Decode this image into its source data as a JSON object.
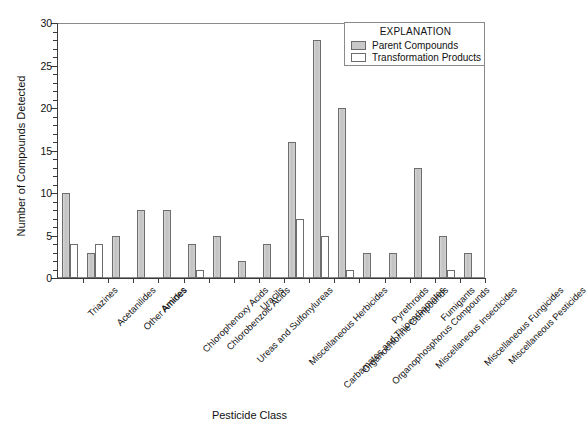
{
  "chart_data": {
    "type": "bar",
    "title": "",
    "xlabel": "Pesticide Class",
    "ylabel": "Number of Compounds Detected",
    "ylim": [
      0,
      30
    ],
    "yticks": [
      0,
      5,
      10,
      15,
      20,
      25,
      30
    ],
    "grid": false,
    "legend_position": "top-right",
    "legend_title": "EXPLANATION",
    "categories": [
      "Triazines",
      "Acetanilides",
      "Other Amides",
      "Amines",
      "Chlorophenoxy Acids",
      "Chlorobenzoic Acids",
      "Ureas and Sulfonylureas",
      "Uracils",
      "Miscellaneous Herbicides",
      "Carbamates and Thiocarbamates",
      "Organochlorine Compounds",
      "Organophosphorus Compounds",
      "Pyrethroids",
      "Miscellaneous Insecticides",
      "Fumigants",
      "Miscellaneous Fungicides",
      "Miscellaneous Pesticides"
    ],
    "series": [
      {
        "name": "Parent Compounds",
        "color": "#c9c9c9",
        "values": [
          10,
          3,
          5,
          8,
          8,
          4,
          5,
          2,
          4,
          16,
          28,
          20,
          3,
          3,
          13,
          5,
          3
        ]
      },
      {
        "name": "Transformation Products",
        "color": "#ffffff",
        "values": [
          4,
          4,
          0,
          0,
          0,
          1,
          0,
          0,
          0,
          7,
          5,
          1,
          0,
          0,
          0,
          1,
          0
        ]
      }
    ]
  },
  "axes": {
    "y_title": "Number of Compounds Detected",
    "x_title": "Pesticide Class",
    "y_tick_labels": [
      "0",
      "5",
      "10",
      "15",
      "20",
      "25",
      "30"
    ]
  },
  "legend": {
    "title": "EXPLANATION",
    "entries": [
      {
        "label": "Parent Compounds",
        "swatch": "parent"
      },
      {
        "label": "Transformation Products",
        "swatch": "transform"
      }
    ]
  }
}
